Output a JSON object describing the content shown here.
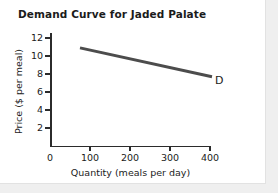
{
  "figure": {
    "background_color": "#ffffff",
    "page_background_color": "#efefef",
    "border_color": "#e2e2e2"
  },
  "chart_data": {
    "type": "line",
    "title": "Demand Curve for Jaded Palate",
    "xlabel": "Quantity (meals per day)",
    "ylabel": "Price ($ per meal)",
    "xlim": [
      0,
      410
    ],
    "ylim": [
      0,
      12.8
    ],
    "grid": false,
    "legend": "none",
    "xticks": [
      0,
      100,
      200,
      300,
      400
    ],
    "xtick_labels": [
      "0",
      "100",
      "200",
      "300",
      "400"
    ],
    "yticks": [
      2,
      4,
      6,
      8,
      10,
      12
    ],
    "ytick_labels": [
      "2",
      "4",
      "6",
      "8",
      "10",
      "12"
    ],
    "series": [
      {
        "name": "D",
        "label": "D",
        "color": "#4c4c4c",
        "line_width": 3,
        "x": [
          75,
          405
        ],
        "y": [
          10.9,
          7.7
        ],
        "annotation": "D",
        "annotation_x": 410,
        "annotation_y": 7.3
      }
    ]
  }
}
